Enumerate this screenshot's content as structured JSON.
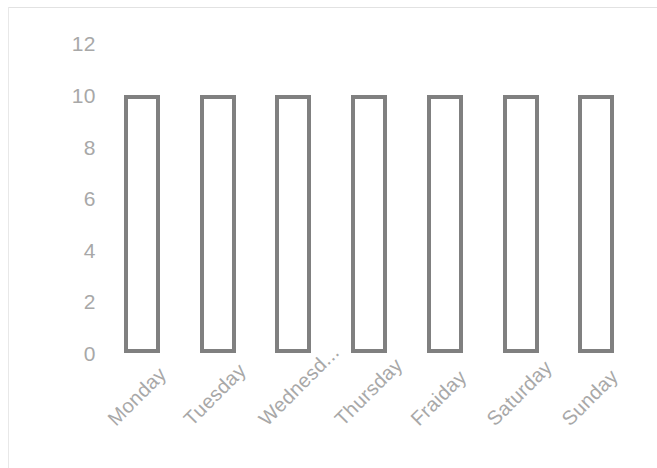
{
  "chart_data": {
    "type": "bar",
    "title": "",
    "subtitle": "",
    "xlabel": "",
    "ylabel": "",
    "categories": [
      "Monday",
      "Tuesday",
      "Wednesd...",
      "Thursday",
      "Fraiday",
      "Saturday",
      "Sunday"
    ],
    "values": [
      10,
      10,
      10,
      10,
      10,
      10,
      10
    ],
    "ylim": [
      0,
      12
    ],
    "y_ticks": [
      "0",
      "2",
      "4",
      "6",
      "8",
      "10",
      "12"
    ],
    "y_tick_values": [
      0,
      2,
      4,
      6,
      8,
      10,
      12
    ],
    "grid": false,
    "legend": null,
    "legend_position": "none",
    "annotations": [],
    "bar_style": {
      "fill": "#ffffff",
      "border": "#808080",
      "border_width": 4
    },
    "axis_label_color": "#a8a8a8",
    "frame_color": "#e2e2e2",
    "x_label_rotation": -45
  }
}
